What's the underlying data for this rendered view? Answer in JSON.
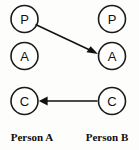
{
  "diagram": {
    "type": "transactional-analysis-ego-state-diagram",
    "background_color": "#fdfdfb",
    "stroke_color": "#111111",
    "circle_fill": "#ffffff",
    "columns": [
      {
        "id": "person-a",
        "label": "Person A",
        "label_x": 32,
        "label_y": 141,
        "center_x": 24.5,
        "ego_states": [
          {
            "id": "a-parent",
            "letter": "P",
            "cx": 24.5,
            "cy": 19,
            "r": 13.5
          },
          {
            "id": "a-adult",
            "letter": "A",
            "cx": 24.5,
            "cy": 56,
            "r": 13.5
          },
          {
            "id": "a-child",
            "letter": "C",
            "cx": 24.5,
            "cy": 101,
            "r": 13.5
          }
        ]
      },
      {
        "id": "person-b",
        "label": "Person B",
        "label_x": 107,
        "label_y": 141,
        "center_x": 112,
        "ego_states": [
          {
            "id": "b-parent",
            "letter": "P",
            "cx": 112,
            "cy": 19,
            "r": 13.5
          },
          {
            "id": "b-adult",
            "letter": "A",
            "cx": 112,
            "cy": 56,
            "r": 13.5
          },
          {
            "id": "b-child",
            "letter": "C",
            "cx": 112,
            "cy": 101,
            "r": 13.5
          }
        ]
      }
    ],
    "transactions": [
      {
        "id": "stimulus-arrow",
        "from": "a-parent",
        "to": "b-adult",
        "direction": "left-to-right-descending",
        "x1": 35.5,
        "y1": 24.5,
        "x2": 97,
        "y2": 53.5,
        "arrowhead_at": "end"
      },
      {
        "id": "response-arrow",
        "from": "b-child",
        "to": "a-child",
        "direction": "right-to-left-horizontal",
        "x1": 97.5,
        "y1": 101,
        "x2": 39,
        "y2": 101,
        "arrowhead_at": "end"
      }
    ]
  }
}
